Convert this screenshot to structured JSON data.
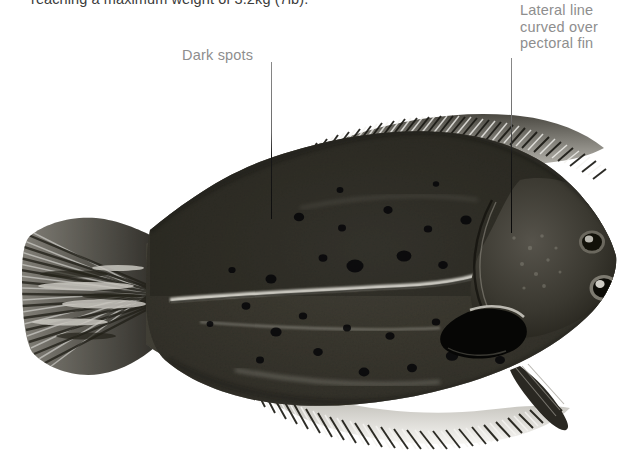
{
  "page": {
    "background_color": "#ffffff",
    "width": 637,
    "height": 457,
    "kind": "field-guide-illustration"
  },
  "caption": {
    "text": "reaching a maximum weight of 3.2kg (7lb).",
    "color": "#3b3b3b",
    "clipped_at_top": true
  },
  "annotations": [
    {
      "id": "dark-spots",
      "text": "Dark spots",
      "lines": [
        "Dark spots"
      ],
      "color": "#8e8e8e",
      "leader": {
        "x": 271,
        "y_start": 62,
        "y_end": 219
      }
    },
    {
      "id": "lateral-line",
      "text": "Lateral line curved over pectoral fin",
      "lines": [
        "Lateral line",
        "curved over",
        "pectoral fin"
      ],
      "color": "#8e8e8e",
      "leader": {
        "x": 511,
        "y_start": 58,
        "y_end": 233
      }
    }
  ],
  "illustration": {
    "subject": "flounder",
    "description": "Lateral view of a flatfish (flounder) facing right, both eyes on the upper side, dark mottled body with dark spots, long dorsal and anal fin rays, fan-shaped caudal fin at left",
    "style": "monochrome halftone photograph",
    "body_color": "#2b2a27",
    "fin_ray_color": "#d9d8d4",
    "spot_color": "#0b0b0b",
    "highlight_color": "#e2e1dc",
    "parts": [
      "caudal-fin",
      "caudal-peduncle",
      "dorsal-fin",
      "anal-fin",
      "pectoral-fin",
      "pelvic-fin",
      "lateral-line",
      "upper-eye",
      "lower-eye",
      "gill-cover",
      "mouth",
      "dark-spots"
    ]
  }
}
